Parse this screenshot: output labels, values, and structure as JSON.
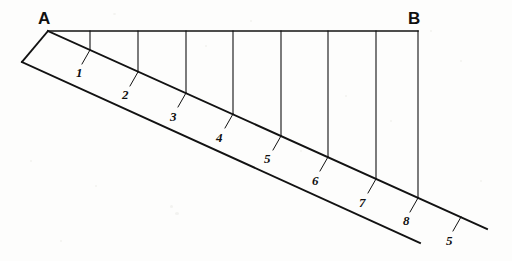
{
  "figure": {
    "type": "line-diagram",
    "title": "",
    "background_color": "#fdfdfc",
    "stroke_color": "#121212",
    "vertices": [
      {
        "id": "A",
        "label": "A",
        "x": 48,
        "y": 31,
        "label_x": 38,
        "label_y": 10
      },
      {
        "id": "B",
        "label": "B",
        "x": 418,
        "y": 31,
        "label_x": 408,
        "label_y": 10
      }
    ],
    "baseline": {
      "name": "top-horizontal-line-AB",
      "x1": 48,
      "y1": 31,
      "x2": 418,
      "y2": 31
    },
    "diagonal_upper": {
      "name": "upper-diagonal-line",
      "x1": 48,
      "y1": 31,
      "x2": 487,
      "y2": 229
    },
    "diagonal_lower": {
      "name": "lower-parallel-line",
      "x1": 22,
      "y1": 62,
      "x2": 420,
      "y2": 243
    },
    "end_cap": {
      "name": "left-end-cap",
      "x1": 48,
      "y1": 31,
      "x2": 22,
      "y2": 62
    },
    "verticals": [
      {
        "name": "vertical-1",
        "x": 90,
        "y1": 31,
        "y2": 50
      },
      {
        "name": "vertical-2",
        "x": 138,
        "y1": 31,
        "y2": 72
      },
      {
        "name": "vertical-3",
        "x": 186,
        "y1": 31,
        "y2": 93
      },
      {
        "name": "vertical-4",
        "x": 233,
        "y1": 31,
        "y2": 114
      },
      {
        "name": "vertical-5",
        "x": 281,
        "y1": 31,
        "y2": 136
      },
      {
        "name": "vertical-6",
        "x": 328,
        "y1": 31,
        "y2": 157
      },
      {
        "name": "vertical-7",
        "x": 376,
        "y1": 31,
        "y2": 179
      },
      {
        "name": "vertical-8",
        "x": 418,
        "y1": 31,
        "y2": 198
      }
    ],
    "stations": [
      {
        "label": "1",
        "tick_x1": 90,
        "tick_y1": 50,
        "tick_x2": 82,
        "tick_y2": 64,
        "label_x": 76,
        "label_y": 66
      },
      {
        "label": "2",
        "tick_x1": 138,
        "tick_y1": 72,
        "tick_x2": 130,
        "tick_y2": 86,
        "label_x": 122,
        "label_y": 88
      },
      {
        "label": "3",
        "tick_x1": 186,
        "tick_y1": 93,
        "tick_x2": 178,
        "tick_y2": 107,
        "label_x": 170,
        "label_y": 110
      },
      {
        "label": "4",
        "tick_x1": 233,
        "tick_y1": 114,
        "tick_x2": 225,
        "tick_y2": 128,
        "label_x": 216,
        "label_y": 131
      },
      {
        "label": "5",
        "tick_x1": 281,
        "tick_y1": 136,
        "tick_x2": 273,
        "tick_y2": 150,
        "label_x": 264,
        "label_y": 152
      },
      {
        "label": "6",
        "tick_x1": 328,
        "tick_y1": 157,
        "tick_x2": 320,
        "tick_y2": 171,
        "label_x": 312,
        "label_y": 174
      },
      {
        "label": "7",
        "tick_x1": 376,
        "tick_y1": 179,
        "tick_x2": 368,
        "tick_y2": 193,
        "label_x": 359,
        "label_y": 196
      },
      {
        "label": "8",
        "tick_x1": 418,
        "tick_y1": 198,
        "tick_x2": 410,
        "tick_y2": 212,
        "label_x": 403,
        "label_y": 214
      },
      {
        "label": "5",
        "tick_x1": 461,
        "tick_y1": 217,
        "tick_x2": 453,
        "tick_y2": 231,
        "label_x": 446,
        "label_y": 234
      }
    ]
  }
}
